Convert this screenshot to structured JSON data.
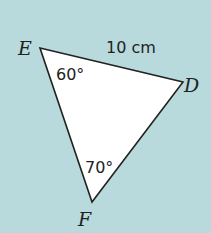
{
  "diagram": {
    "background_color": "#b8dadd",
    "triangle": {
      "fill": "#ffffff",
      "stroke": "#222222",
      "vertices": {
        "E": {
          "label": "E",
          "x": 40,
          "y": 48
        },
        "D": {
          "label": "D",
          "x": 183,
          "y": 82
        },
        "F": {
          "label": "F",
          "x": 92,
          "y": 202
        }
      }
    },
    "side_ED": {
      "label": "10 cm"
    },
    "angle_E": {
      "label": "60°"
    },
    "angle_F": {
      "label": "70°"
    }
  }
}
